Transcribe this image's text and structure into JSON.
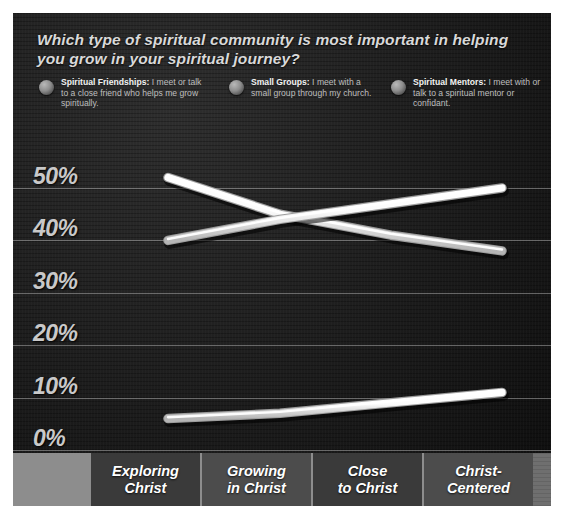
{
  "header": {
    "question": "Which type of spiritual community is most important in helping you grow in your spiritual journey?"
  },
  "legend": [
    {
      "name": "Spiritual Friendships",
      "label": "Spiritual Friendships:",
      "description": " I meet or talk to a close friend who helps me grow spiritually.",
      "marker": "sphere-bullet"
    },
    {
      "name": "Small Groups",
      "label": "Small Groups:",
      "description": " I meet with a small group through my church.",
      "marker": "sphere-bullet"
    },
    {
      "name": "Spiritual Mentors",
      "label": "Spiritual Mentors:",
      "description": " I meet with or talk to a spiritual mentor or confidant.",
      "marker": "sphere-bullet"
    }
  ],
  "axis": {
    "y_ticks": [
      "50%",
      "40%",
      "30%",
      "20%",
      "10%",
      "0%"
    ],
    "x_categories": [
      "Exploring Christ",
      "Growing in Christ",
      "Close to Christ",
      "Christ-Centered"
    ]
  },
  "colors": {
    "panel_background": "#1b1b1b",
    "line": "#f4f4f4",
    "gridline": "#e1e1e1",
    "axis_band": "#6f6f6f",
    "text": "#d9d9d9"
  },
  "chart_data": {
    "type": "line",
    "title": "Which type of spiritual community is most important in helping you grow in your spiritual journey?",
    "xlabel": "",
    "ylabel": "",
    "categories": [
      "Exploring Christ",
      "Growing in Christ",
      "Close to Christ",
      "Christ-Centered"
    ],
    "series": [
      {
        "name": "Spiritual Friendships",
        "values": [
          52,
          45,
          41,
          38
        ]
      },
      {
        "name": "Small Groups",
        "values": [
          40,
          44,
          47,
          50
        ]
      },
      {
        "name": "Spiritual Mentors",
        "values": [
          6,
          7,
          9,
          11
        ]
      }
    ],
    "ylim": [
      0,
      55
    ],
    "yticks": [
      0,
      10,
      20,
      30,
      40,
      50
    ],
    "ytick_labels": [
      "0%",
      "10%",
      "20%",
      "30%",
      "40%",
      "50%"
    ],
    "grid": true,
    "legend_position": "top"
  }
}
